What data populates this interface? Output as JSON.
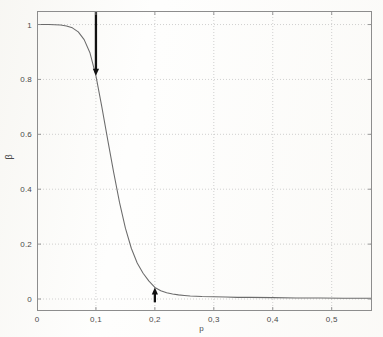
{
  "chart_data": {
    "type": "line",
    "title": "",
    "subtitle": "",
    "xlabel": "p",
    "ylabel": "β",
    "xlim": [
      0,
      0.5684
    ],
    "ylim": [
      -0.0437,
      1.0493
    ],
    "grid": true,
    "legend": null,
    "legend_position": "none",
    "x_tick_labels": [
      "0",
      "0,1",
      "0,2",
      "0,3",
      "0,4",
      "0,5"
    ],
    "x_tick_values": [
      0,
      0.1,
      0.2,
      0.3,
      0.4,
      0.5
    ],
    "y_tick_labels": [
      "0",
      "0.2",
      "0.4",
      "0.6",
      "0.8",
      "1"
    ],
    "y_tick_values": [
      0,
      0.2,
      0.4,
      0.6,
      0.8,
      1
    ],
    "series": [
      {
        "name": "beta",
        "color": "#6b6b6b",
        "x": [
          0,
          0.01,
          0.02,
          0.03,
          0.04,
          0.05,
          0.06,
          0.07,
          0.08,
          0.09,
          0.1,
          0.11,
          0.12,
          0.13,
          0.14,
          0.15,
          0.16,
          0.17,
          0.18,
          0.19,
          0.2,
          0.21,
          0.22,
          0.23,
          0.24,
          0.25,
          0.26,
          0.28,
          0.3,
          0.32,
          0.34,
          0.36,
          0.4,
          0.44,
          0.48,
          0.52,
          0.5684
        ],
        "values": [
          1.0,
          1.0,
          1.0,
          0.999,
          0.998,
          0.995,
          0.988,
          0.973,
          0.945,
          0.896,
          0.813,
          0.7,
          0.58,
          0.462,
          0.352,
          0.258,
          0.185,
          0.131,
          0.094,
          0.065,
          0.042,
          0.03,
          0.023,
          0.018,
          0.015,
          0.013,
          0.011,
          0.009,
          0.008,
          0.007,
          0.006,
          0.006,
          0.005,
          0.004,
          0.004,
          0.003,
          0.003
        ]
      }
    ],
    "annotations": [
      {
        "name": "down-arrow-annotation",
        "kind": "arrow",
        "direction": "down",
        "x": 0.1,
        "y_start": 1.047,
        "y_end": 0.813,
        "color": "#111111"
      },
      {
        "name": "up-arrow-annotation",
        "kind": "arrow",
        "direction": "up",
        "x": 0.2,
        "y_start": -0.012,
        "y_end": 0.042,
        "color": "#111111"
      }
    ]
  },
  "axes": {
    "frame_color": "#8d8d8d",
    "grid_color": "#bdbdbd"
  }
}
